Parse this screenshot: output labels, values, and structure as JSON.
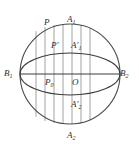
{
  "figure": {
    "type": "geometry-diagram",
    "colors": {
      "stroke": "#4a4a4a",
      "ellipse_stroke": "#3c3c3c",
      "chord_stroke": "#7a7a7a",
      "label": "#2b2b2b",
      "background": "#ffffff"
    },
    "geometry": {
      "center": {
        "x": 70,
        "y": 74
      },
      "circle_radius": 50,
      "ellipse_rx": 50,
      "ellipse_ry": 21,
      "chord_x_positions": [
        36,
        45,
        54,
        63,
        72,
        81,
        90
      ],
      "horizontal_axis_y": 74
    },
    "labels": [
      {
        "id": "label-P",
        "text": "P",
        "sub": "",
        "prime": "",
        "x": 44,
        "y": 18
      },
      {
        "id": "label-A1",
        "text": "A",
        "sub": "1",
        "prime": "",
        "x": 67,
        "y": 15
      },
      {
        "id": "label-P-prime",
        "text": "P",
        "sub": "",
        "prime": "′",
        "x": 51,
        "y": 41
      },
      {
        "id": "label-A1-prime",
        "text": "A",
        "sub": "1",
        "prime": "′",
        "x": 71,
        "y": 41
      },
      {
        "id": "label-B1",
        "text": "B",
        "sub": "1",
        "prime": "",
        "x": 4,
        "y": 69
      },
      {
        "id": "label-B2",
        "text": "B",
        "sub": "2",
        "prime": "",
        "x": 120,
        "y": 69
      },
      {
        "id": "label-P0",
        "text": "P",
        "sub": "0",
        "prime": "",
        "x": 45,
        "y": 78
      },
      {
        "id": "label-O",
        "text": "O",
        "sub": "",
        "prime": "",
        "x": 72,
        "y": 78
      },
      {
        "id": "label-A2-prime",
        "text": "A",
        "sub": "2",
        "prime": "′",
        "x": 71,
        "y": 100
      },
      {
        "id": "label-A2",
        "text": "A",
        "sub": "2",
        "prime": "",
        "x": 67,
        "y": 131
      }
    ]
  }
}
